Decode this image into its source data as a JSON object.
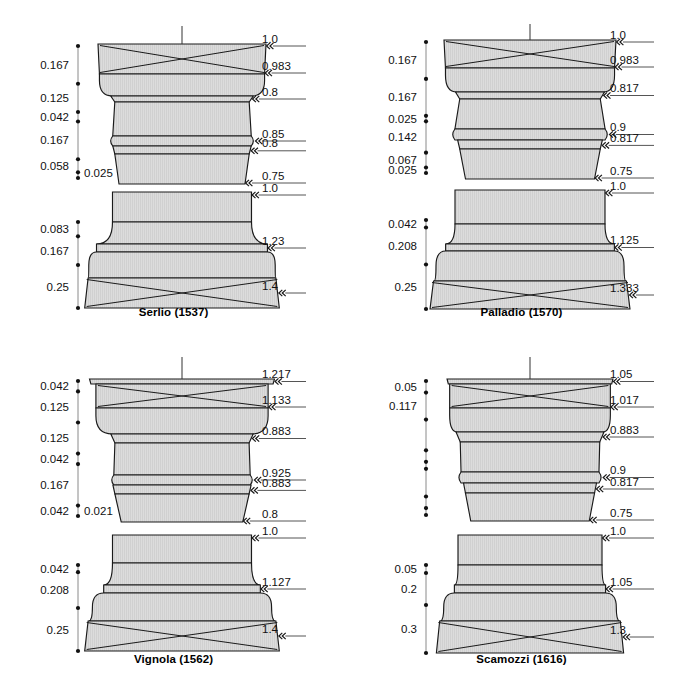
{
  "figure": {
    "background": "#ffffff",
    "fill": "#dcdcdc",
    "stroke": "#1a1a1a",
    "panel_count": 4
  },
  "panels": [
    {
      "id": "serlio",
      "caption": "Serlio (1537)",
      "capital": {
        "scale_labels": [
          "0.167",
          "0.125",
          "0.042",
          "0.167",
          "0.058"
        ],
        "aside_label": "0.025",
        "tick_values": [
          0.0,
          0.167,
          0.292,
          0.334,
          0.501,
          0.559,
          0.584
        ],
        "width_labels": [
          "1.0",
          "0.983",
          "0.8",
          "0.85",
          "0.8",
          "0.75"
        ],
        "widths": [
          1.0,
          0.983,
          0.8,
          0.85,
          0.8,
          0.75
        ]
      },
      "base": {
        "scale_labels": [
          "0.083",
          "0.167",
          "0.25"
        ],
        "tick_values": [
          0.0,
          0.083,
          0.25,
          0.5
        ],
        "width_labels": [
          "1.0",
          "1.23",
          "1.4"
        ],
        "widths": [
          1.0,
          1.23,
          1.4
        ]
      }
    },
    {
      "id": "palladio",
      "caption": "Palladio (1570)",
      "capital": {
        "scale_labels": [
          "0.167",
          "0.167",
          "0.025",
          "0.142",
          "0.067",
          "0.025"
        ],
        "aside_label": "",
        "tick_values": [
          0.0,
          0.167,
          0.334,
          0.359,
          0.501,
          0.568,
          0.593
        ],
        "width_labels": [
          "1.0",
          "0.983",
          "0.817",
          "0.9",
          "0.817",
          "0.75"
        ],
        "widths": [
          1.0,
          0.983,
          0.817,
          0.9,
          0.817,
          0.75
        ]
      },
      "base": {
        "scale_labels": [
          "0.042",
          "0.208",
          "0.25"
        ],
        "tick_values": [
          0.0,
          0.042,
          0.25,
          0.5
        ],
        "width_labels": [
          "1.0",
          "1.125",
          "1.333"
        ],
        "widths": [
          1.0,
          1.125,
          1.333
        ]
      }
    },
    {
      "id": "vignola",
      "caption": "Vignola (1562)",
      "capital": {
        "scale_labels": [
          "0.042",
          "0.125",
          "0.125",
          "0.042",
          "0.167",
          "0.042"
        ],
        "aside_label": "0.021",
        "tick_values": [
          0.0,
          0.042,
          0.167,
          0.292,
          0.334,
          0.501,
          0.543
        ],
        "width_labels": [
          "1.217",
          "1.133",
          "0.883",
          "0.925",
          "0.883",
          "0.8"
        ],
        "widths": [
          1.217,
          1.133,
          0.883,
          0.925,
          0.883,
          0.8
        ]
      },
      "base": {
        "scale_labels": [
          "0.042",
          "0.208",
          "0.25"
        ],
        "tick_values": [
          0.0,
          0.042,
          0.25,
          0.5
        ],
        "width_labels": [
          "1.0",
          "1.127",
          "1.4"
        ],
        "widths": [
          1.0,
          1.127,
          1.4
        ]
      }
    },
    {
      "id": "scamozzi",
      "caption": "Scamozzi (1616)",
      "capital": {
        "scale_labels": [
          "0.05",
          "0.117"
        ],
        "aside_label": "",
        "tick_values": [
          0.0,
          0.05,
          0.167,
          0.3,
          0.35,
          0.38,
          0.5,
          0.55,
          0.58
        ],
        "width_labels": [
          "1.05",
          "1.017",
          "0.883",
          "0.9",
          "0.817",
          "0.75"
        ],
        "widths": [
          1.05,
          1.017,
          0.883,
          0.9,
          0.817,
          0.75
        ]
      },
      "base": {
        "scale_labels": [
          "0.05",
          "0.2",
          "0.3"
        ],
        "tick_values": [
          0.0,
          0.05,
          0.25,
          0.55
        ],
        "width_labels": [
          "1.0",
          "1.05",
          "1.3"
        ],
        "widths": [
          1.0,
          1.05,
          1.3
        ]
      }
    }
  ],
  "chart_data": {
    "type": "diagram",
    "units": "column diameters (module)",
    "series": [
      {
        "name": "Serlio (1537)",
        "capital_heights": [
          "0.167",
          "0.125",
          "0.042",
          "0.167",
          "0.058",
          "0.025"
        ],
        "capital_widths": [
          "1.0",
          "0.983",
          "0.8",
          "0.85",
          "0.8",
          "0.75"
        ],
        "base_heights": [
          "0.083",
          "0.167",
          "0.25"
        ],
        "base_widths": [
          "1.0",
          "1.23",
          "1.4"
        ]
      },
      {
        "name": "Palladio (1570)",
        "capital_heights": [
          "0.167",
          "0.167",
          "0.025",
          "0.142",
          "0.067",
          "0.025"
        ],
        "capital_widths": [
          "1.0",
          "0.983",
          "0.817",
          "0.9",
          "0.817",
          "0.75"
        ],
        "base_heights": [
          "0.042",
          "0.208",
          "0.25"
        ],
        "base_widths": [
          "1.0",
          "1.125",
          "1.333"
        ]
      },
      {
        "name": "Vignola (1562)",
        "capital_heights": [
          "0.042",
          "0.125",
          "0.125",
          "0.042",
          "0.167",
          "0.042",
          "0.021"
        ],
        "capital_widths": [
          "1.217",
          "1.133",
          "0.883",
          "0.925",
          "0.883",
          "0.8"
        ],
        "base_heights": [
          "0.042",
          "0.208",
          "0.25"
        ],
        "base_widths": [
          "1.0",
          "1.127",
          "1.4"
        ]
      },
      {
        "name": "Scamozzi (1616)",
        "capital_heights": [
          "0.05",
          "0.117"
        ],
        "capital_widths": [
          "1.05",
          "1.017",
          "0.883",
          "0.9",
          "0.817",
          "0.75"
        ],
        "base_heights": [
          "0.05",
          "0.2",
          "0.3"
        ],
        "base_widths": [
          "1.0",
          "1.05",
          "1.3"
        ]
      }
    ]
  }
}
